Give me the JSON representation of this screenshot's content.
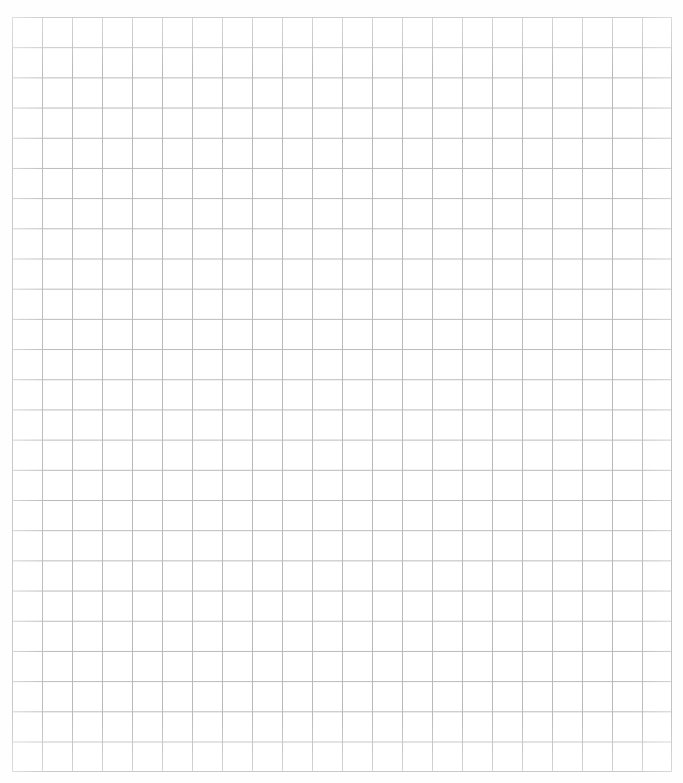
{
  "document": {
    "type": "graph-paper",
    "title": "Blank Graph Paper Grid",
    "description": "Scanned blank square-ruled graph paper sheet with no writing or markings",
    "background_color": "#ffffff",
    "paper_tint": "#fdfdfd"
  },
  "grid": {
    "origin_x": 12,
    "origin_y": 17,
    "width": 660,
    "height": 755,
    "columns": 22,
    "rows": 25,
    "cell_width": 30,
    "cell_height": 30.2,
    "line_color": "#b9b9b9",
    "line_width": 1,
    "frame_color": "#a8a8a8",
    "frame_width": 1,
    "subdivisions": 0,
    "labels": [],
    "annotations": []
  },
  "content": {
    "text_present": "none",
    "marks_present": "none"
  }
}
